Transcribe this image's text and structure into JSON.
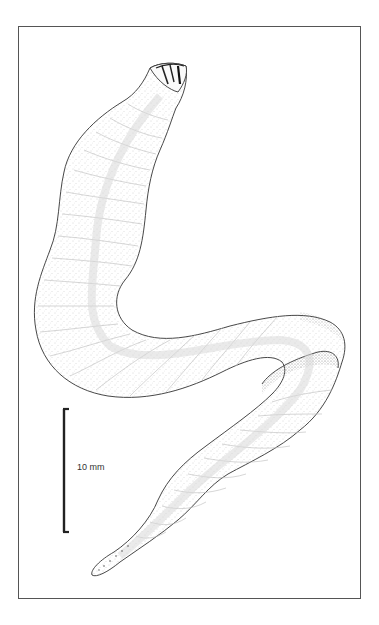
{
  "figure": {
    "caption_clipped": "",
    "colors": {
      "frame": "#555555",
      "outline": "#333333",
      "stipple": "#9a9a9a",
      "scale_bar": "#222222",
      "background": "#ffffff"
    }
  },
  "scale_bar": {
    "label": "10 mm",
    "length_value": 10,
    "unit": "mm"
  }
}
